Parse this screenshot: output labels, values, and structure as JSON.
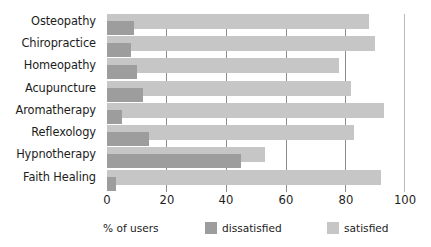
{
  "chart_data": {
    "type": "bar",
    "orientation": "horizontal",
    "title": "",
    "xlabel": "% of users",
    "ylabel": "",
    "xlim": [
      0,
      100
    ],
    "xticks": [
      0,
      20,
      40,
      60,
      80,
      100
    ],
    "grid": true,
    "legend_position": "bottom",
    "categories": [
      "Osteopathy",
      "Chiropractice",
      "Homeopathy",
      "Acupuncture",
      "Aromatherapy",
      "Reflexology",
      "Hypnotherapy",
      "Faith Healing"
    ],
    "series": [
      {
        "name": "satisfied",
        "color": "#c6c6c6",
        "values": [
          88,
          90,
          78,
          82,
          93,
          83,
          53,
          92
        ]
      },
      {
        "name": "dissatisfied",
        "color": "#9d9d9d",
        "values": [
          9,
          8,
          10,
          12,
          5,
          14,
          45,
          3
        ]
      }
    ]
  },
  "axis": {
    "x_label": "% of users",
    "ticks": [
      "0",
      "20",
      "40",
      "60",
      "80",
      "100"
    ]
  },
  "legend": {
    "items": [
      {
        "label": "dissatisfied",
        "color": "#9d9d9d"
      },
      {
        "label": "satisfied",
        "color": "#c6c6c6"
      }
    ]
  }
}
